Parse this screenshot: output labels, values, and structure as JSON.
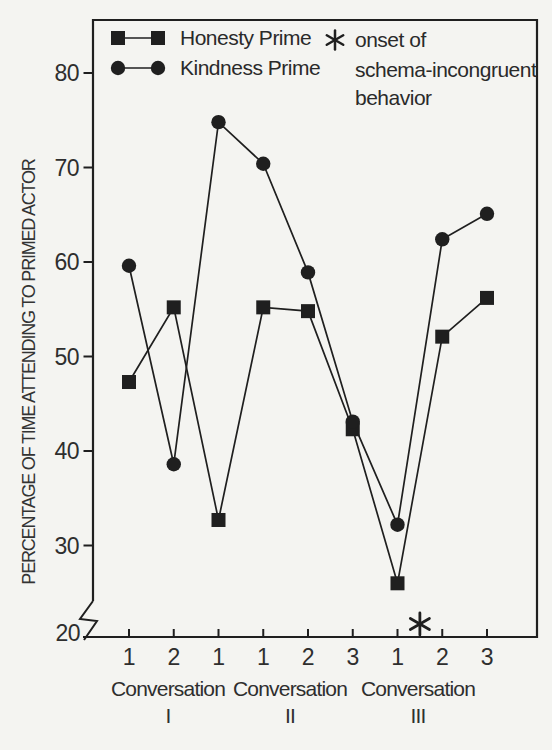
{
  "legend": {
    "series": [
      {
        "label": "Honesty Prime",
        "marker": "square"
      },
      {
        "label": "Kindness Prime",
        "marker": "circle"
      }
    ],
    "note_symbol": "*",
    "note_lines": [
      "onset of",
      "schema-incongruent",
      "behavior"
    ]
  },
  "chart_data": {
    "type": "line",
    "title": "",
    "xlabel": "",
    "ylabel": "PERCENTAGE OF TIME ATTENDING TO PRIMED ACTOR",
    "ylim": [
      20,
      86
    ],
    "axis_break_above": 20,
    "grid": false,
    "legend_position": "top-left-inside",
    "y_ticks": [
      80,
      70,
      60,
      50,
      40,
      30,
      20
    ],
    "x_tick_labels": [
      "1",
      "2",
      "1",
      "1",
      "2",
      "3",
      "1",
      "2",
      "3"
    ],
    "groups": [
      {
        "label": "Conversation",
        "numeral": "I"
      },
      {
        "label": "Conversation",
        "numeral": "II"
      },
      {
        "label": "Conversation",
        "numeral": "III"
      }
    ],
    "series": [
      {
        "name": "Honesty Prime",
        "marker": "square",
        "values": [
          47.3,
          55.2,
          32.7,
          55.2,
          54.8,
          42.3,
          26.0,
          52.1,
          56.2
        ]
      },
      {
        "name": "Kindness Prime",
        "marker": "circle",
        "values": [
          59.6,
          38.6,
          74.8,
          70.4,
          58.9,
          43.1,
          32.2,
          62.4,
          65.1
        ]
      }
    ],
    "annotation": {
      "symbol": "*",
      "meaning": "onset of schema-incongruent behavior",
      "between_x_ticks": [
        7,
        8
      ]
    }
  },
  "colors": {
    "ink": "#1f1f1f",
    "text": "#2e2e2e",
    "background": "#f4f4f1"
  }
}
